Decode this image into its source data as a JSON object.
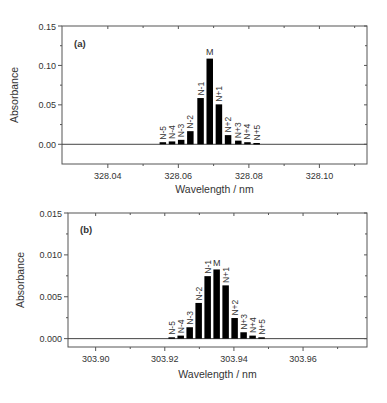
{
  "chart_data": [
    {
      "type": "bar",
      "panel_label": "(a)",
      "title": "",
      "xlabel": "Wavelength / nm",
      "ylabel": "Absorbance",
      "xlim": [
        328.027,
        328.1135
      ],
      "ylim": [
        -0.025,
        0.15
      ],
      "xticks": [
        328.04,
        328.06,
        328.08,
        328.1
      ],
      "xtick_labels": [
        "328.04",
        "328.06",
        "328.08",
        "328.10"
      ],
      "yticks": [
        0.0,
        0.05,
        0.1,
        0.15
      ],
      "ytick_labels": [
        "0.00",
        "0.05",
        "0.10",
        "0.15"
      ],
      "zero_line": true,
      "grid": false,
      "categories": [
        "N-5",
        "N-4",
        "N-3",
        "N-2",
        "N-1",
        "M",
        "N+1",
        "N+2",
        "N+3",
        "N+4",
        "N+5"
      ],
      "x": [
        328.0556,
        328.0582,
        328.0608,
        328.0634,
        328.0663,
        328.0689,
        328.0715,
        328.0741,
        328.077,
        328.0796,
        328.0822
      ],
      "values": [
        0.002,
        0.003,
        0.005,
        0.016,
        0.058,
        0.108,
        0.05,
        0.011,
        0.004,
        0.002,
        0.001
      ]
    },
    {
      "type": "bar",
      "panel_label": "(b)",
      "title": "",
      "xlabel": "Wavelength / nm",
      "ylabel": "Absorbance",
      "xlim": [
        303.892,
        303.9785
      ],
      "ylim": [
        -0.001,
        0.015
      ],
      "xticks": [
        303.9,
        303.92,
        303.94,
        303.96
      ],
      "xtick_labels": [
        "303.90",
        "303.92",
        "303.94",
        "303.96"
      ],
      "yticks": [
        0.0,
        0.005,
        0.01,
        0.015
      ],
      "ytick_labels": [
        "0.000",
        "0.005",
        "0.010",
        "0.015"
      ],
      "zero_line": true,
      "grid": false,
      "categories": [
        "N-5",
        "N-4",
        "N-3",
        "N-2",
        "N-1",
        "M",
        "N+1",
        "N+2",
        "N+3",
        "N+4",
        "N+5"
      ],
      "x": [
        303.922,
        303.9246,
        303.9272,
        303.9298,
        303.9324,
        303.935,
        303.9376,
        303.9402,
        303.9428,
        303.9454,
        303.948
      ],
      "values": [
        0.0001,
        0.0003,
        0.0013,
        0.0042,
        0.0074,
        0.0082,
        0.0063,
        0.0024,
        0.0007,
        0.0003,
        0.0001
      ]
    }
  ]
}
